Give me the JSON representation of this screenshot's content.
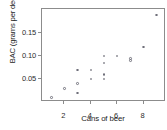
{
  "chart_data": {
    "type": "scatter",
    "title": "",
    "xlabel": "Cans of beer",
    "ylabel": "BAC (grams per deciliter)",
    "xlim": [
      0.3,
      9.7
    ],
    "ylim": [
      0.0,
      0.203
    ],
    "grid": false,
    "legend": null,
    "xticks": [
      2,
      4,
      6,
      8
    ],
    "xtick_labels": [
      "2",
      "4",
      "6",
      "8"
    ],
    "yticks": [
      0.05,
      0.1,
      0.15
    ],
    "ytick_labels": [
      "0.05",
      "0.10",
      "0.15"
    ],
    "marker": "open-circle",
    "marker_color": "#6f6f7a",
    "points": [
      {
        "x": 1,
        "y": 0.01
      },
      {
        "x": 2,
        "y": 0.03
      },
      {
        "x": 3,
        "y": 0.02
      },
      {
        "x": 3,
        "y": 0.04
      },
      {
        "x": 3,
        "y": 0.07
      },
      {
        "x": 4,
        "y": 0.05
      },
      {
        "x": 4,
        "y": 0.07
      },
      {
        "x": 5,
        "y": 0.05
      },
      {
        "x": 5,
        "y": 0.06
      },
      {
        "x": 5,
        "y": 0.085
      },
      {
        "x": 5,
        "y": 0.1
      },
      {
        "x": 6,
        "y": 0.1
      },
      {
        "x": 7,
        "y": 0.09
      },
      {
        "x": 7,
        "y": 0.095
      },
      {
        "x": 8,
        "y": 0.12
      },
      {
        "x": 9,
        "y": 0.19
      }
    ]
  }
}
